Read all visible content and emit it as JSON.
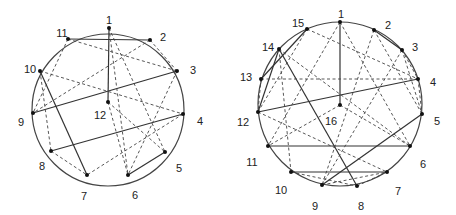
{
  "diagrams": [
    {
      "id": "left",
      "circle": {
        "cx": 108,
        "cy": 110,
        "r": 76
      },
      "nodes": [
        {
          "id": "1",
          "x": 109,
          "y": 28,
          "lx": 109,
          "ly": 20,
          "anchor": "middle"
        },
        {
          "id": "2",
          "x": 150,
          "y": 40,
          "lx": 163,
          "ly": 37,
          "anchor": "middle"
        },
        {
          "id": "3",
          "x": 177,
          "y": 71,
          "lx": 193,
          "ly": 70,
          "anchor": "middle"
        },
        {
          "id": "4",
          "x": 183,
          "y": 114,
          "lx": 200,
          "ly": 121,
          "anchor": "middle"
        },
        {
          "id": "5",
          "x": 165,
          "y": 152,
          "lx": 179,
          "ly": 168,
          "anchor": "middle"
        },
        {
          "id": "6",
          "x": 128,
          "y": 175,
          "lx": 135,
          "ly": 195,
          "anchor": "middle"
        },
        {
          "id": "7",
          "x": 87,
          "y": 175,
          "lx": 84,
          "ly": 196,
          "anchor": "middle"
        },
        {
          "id": "8",
          "x": 51,
          "y": 151,
          "lx": 42,
          "ly": 166,
          "anchor": "middle"
        },
        {
          "id": "9",
          "x": 33,
          "y": 113,
          "lx": 21,
          "ly": 122,
          "anchor": "middle"
        },
        {
          "id": "10",
          "x": 40,
          "y": 71,
          "lx": 30,
          "ly": 69,
          "anchor": "middle"
        },
        {
          "id": "11",
          "x": 68,
          "y": 39,
          "lx": 62,
          "ly": 33,
          "anchor": "middle"
        },
        {
          "id": "12",
          "x": 108,
          "y": 102,
          "lx": 100,
          "ly": 115,
          "anchor": "middle"
        }
      ],
      "edges": [
        {
          "a": "1",
          "b": "12",
          "style": "solid"
        },
        {
          "a": "11",
          "b": "2",
          "style": "solid"
        },
        {
          "a": "3",
          "b": "9",
          "style": "solid"
        },
        {
          "a": "4",
          "b": "8",
          "style": "solid"
        },
        {
          "a": "10",
          "b": "7",
          "style": "solid"
        },
        {
          "a": "5",
          "b": "6",
          "style": "solid"
        },
        {
          "a": "1",
          "b": "6",
          "style": "dashed"
        },
        {
          "a": "1",
          "b": "5",
          "style": "dashed"
        },
        {
          "a": "11",
          "b": "3",
          "style": "dashed"
        },
        {
          "a": "11",
          "b": "9",
          "style": "dashed"
        },
        {
          "a": "2",
          "b": "9",
          "style": "dashed"
        },
        {
          "a": "2",
          "b": "3",
          "style": "dashed"
        },
        {
          "a": "10",
          "b": "4",
          "style": "dashed"
        },
        {
          "a": "10",
          "b": "8",
          "style": "dashed"
        },
        {
          "a": "12",
          "b": "6",
          "style": "dashed"
        },
        {
          "a": "12",
          "b": "5",
          "style": "dashed"
        },
        {
          "a": "4",
          "b": "7",
          "style": "dashed"
        },
        {
          "a": "8",
          "b": "7",
          "style": "dashed"
        },
        {
          "a": "3",
          "b": "6",
          "style": "dashed"
        }
      ]
    },
    {
      "id": "right",
      "circle": {
        "cx": 340,
        "cy": 104,
        "r": 82
      },
      "nodes": [
        {
          "id": "1",
          "x": 340,
          "y": 22,
          "lx": 341,
          "ly": 14,
          "anchor": "middle"
        },
        {
          "id": "2",
          "x": 374,
          "y": 30,
          "lx": 388,
          "ly": 25,
          "anchor": "middle"
        },
        {
          "id": "3",
          "x": 402,
          "y": 50,
          "lx": 415,
          "ly": 47,
          "anchor": "middle"
        },
        {
          "id": "4",
          "x": 418,
          "y": 79,
          "lx": 433,
          "ly": 82,
          "anchor": "middle"
        },
        {
          "id": "5",
          "x": 422,
          "y": 114,
          "lx": 437,
          "ly": 121,
          "anchor": "middle"
        },
        {
          "id": "6",
          "x": 410,
          "y": 146,
          "lx": 423,
          "ly": 164,
          "anchor": "middle"
        },
        {
          "id": "7",
          "x": 387,
          "y": 172,
          "lx": 398,
          "ly": 191,
          "anchor": "middle"
        },
        {
          "id": "8",
          "x": 357,
          "y": 186,
          "lx": 361,
          "ly": 206,
          "anchor": "middle"
        },
        {
          "id": "9",
          "x": 322,
          "y": 185,
          "lx": 315,
          "ly": 206,
          "anchor": "middle"
        },
        {
          "id": "10",
          "x": 291,
          "y": 172,
          "lx": 281,
          "ly": 190,
          "anchor": "middle"
        },
        {
          "id": "11",
          "x": 268,
          "y": 146,
          "lx": 252,
          "ly": 162,
          "anchor": "middle"
        },
        {
          "id": "12",
          "x": 258,
          "y": 112,
          "lx": 243,
          "ly": 122,
          "anchor": "middle"
        },
        {
          "id": "13",
          "x": 261,
          "y": 79,
          "lx": 246,
          "ly": 77,
          "anchor": "middle"
        },
        {
          "id": "14",
          "x": 279,
          "y": 49,
          "lx": 268,
          "ly": 47,
          "anchor": "middle"
        },
        {
          "id": "15",
          "x": 307,
          "y": 29,
          "lx": 298,
          "ly": 23,
          "anchor": "middle"
        },
        {
          "id": "16",
          "x": 340,
          "y": 105,
          "lx": 331,
          "ly": 121,
          "anchor": "middle"
        }
      ],
      "edges": [
        {
          "a": "1",
          "b": "16",
          "style": "solid"
        },
        {
          "a": "4",
          "b": "12",
          "style": "solid"
        },
        {
          "a": "14",
          "b": "8",
          "style": "solid"
        },
        {
          "a": "11",
          "b": "6",
          "style": "solid"
        },
        {
          "a": "10",
          "b": "7",
          "style": "solid"
        },
        {
          "a": "5",
          "b": "9",
          "style": "solid"
        },
        {
          "a": "15",
          "b": "13",
          "style": "solid"
        },
        {
          "a": "14",
          "b": "12",
          "style": "solid"
        },
        {
          "a": "2",
          "b": "3",
          "style": "solid"
        },
        {
          "a": "1",
          "b": "11",
          "style": "dashed"
        },
        {
          "a": "1",
          "b": "6",
          "style": "dashed"
        },
        {
          "a": "15",
          "b": "4",
          "style": "dashed"
        },
        {
          "a": "15",
          "b": "12",
          "style": "dashed"
        },
        {
          "a": "13",
          "b": "4",
          "style": "dashed"
        },
        {
          "a": "13",
          "b": "12",
          "style": "dashed"
        },
        {
          "a": "14",
          "b": "10",
          "style": "dashed"
        },
        {
          "a": "14",
          "b": "6",
          "style": "dashed"
        },
        {
          "a": "2",
          "b": "9",
          "style": "dashed"
        },
        {
          "a": "2",
          "b": "5",
          "style": "dashed"
        },
        {
          "a": "3",
          "b": "9",
          "style": "dashed"
        },
        {
          "a": "3",
          "b": "4",
          "style": "dashed"
        },
        {
          "a": "3",
          "b": "5",
          "style": "dashed"
        },
        {
          "a": "4",
          "b": "5",
          "style": "dashed"
        },
        {
          "a": "16",
          "b": "6",
          "style": "dashed"
        },
        {
          "a": "16",
          "b": "11",
          "style": "dashed"
        },
        {
          "a": "12",
          "b": "7",
          "style": "dashed"
        },
        {
          "a": "9",
          "b": "7",
          "style": "dashed"
        },
        {
          "a": "10",
          "b": "8",
          "style": "dashed"
        },
        {
          "a": "8",
          "b": "7",
          "style": "dashed"
        }
      ]
    }
  ]
}
